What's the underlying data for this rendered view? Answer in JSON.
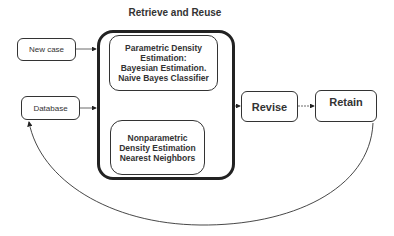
{
  "diagram": {
    "title": "Retrieve and Reuse",
    "inputs": {
      "new_case": "New case",
      "database": "Database"
    },
    "retrieve_reuse": {
      "parametric": {
        "line1": "Parametric Density",
        "line2": "Estimation:",
        "line3": "Bayesian Estimation.",
        "line4": "Naive Bayes Classifier"
      },
      "nonparametric": {
        "line1": "Nonparametric",
        "line2": "Density Estimation",
        "line3": "Nearest Neighbors"
      }
    },
    "revise": "Revise",
    "retain": "Retain",
    "edges": [
      {
        "from": "New case",
        "to": "Retrieve and Reuse"
      },
      {
        "from": "Database",
        "to": "Retrieve and Reuse"
      },
      {
        "from": "Retrieve and Reuse",
        "to": "Revise"
      },
      {
        "from": "Revise",
        "to": "Retain"
      },
      {
        "from": "Retain",
        "to": "Database"
      }
    ]
  }
}
